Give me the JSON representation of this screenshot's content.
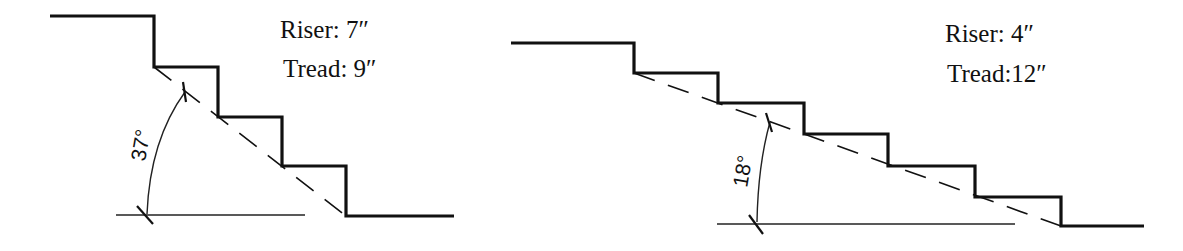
{
  "diagrams": [
    {
      "name": "steep-stair",
      "riser_label": "Riser: 7″",
      "tread_label": "Tread: 9″",
      "riser_in": 7,
      "tread_in": 9,
      "angle_label": "37°",
      "angle_deg": 37,
      "steps": 4
    },
    {
      "name": "shallow-stair",
      "riser_label": "Riser: 4″",
      "tread_label": "Tread:12″",
      "riser_in": 4,
      "tread_in": 12,
      "angle_label": "18°",
      "angle_deg": 18,
      "steps": 6
    }
  ],
  "colors": {
    "line": "#111111",
    "background": "#ffffff"
  }
}
